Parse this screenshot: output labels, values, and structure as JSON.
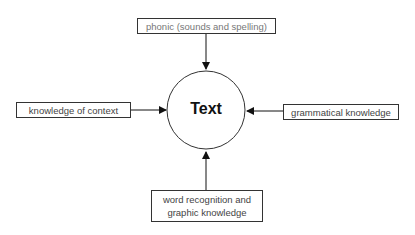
{
  "diagram": {
    "center": {
      "label": "Text"
    },
    "nodes": [
      {
        "id": "top",
        "label": "phonic (sounds and spelling)"
      },
      {
        "id": "left",
        "label": "knowledge of context"
      },
      {
        "id": "right",
        "label": "grammatical knowledge"
      },
      {
        "id": "bottom",
        "label": "word recognition and graphic knowledge",
        "line1": "word recognition and",
        "line2": "graphic knowledge"
      }
    ],
    "edges": [
      {
        "from": "top",
        "to": "center"
      },
      {
        "from": "left",
        "to": "center"
      },
      {
        "from": "right",
        "to": "center"
      },
      {
        "from": "bottom",
        "to": "center"
      }
    ]
  }
}
